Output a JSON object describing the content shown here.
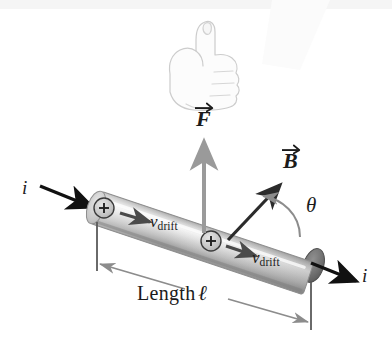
{
  "figure": {
    "background_color": "#ffffff"
  },
  "labels": {
    "force_vector": "F",
    "field_vector": "B",
    "angle": "θ",
    "current_left": "i",
    "current_right": "i",
    "drift_velocity_letter": "v",
    "drift_velocity_subscript": "drift",
    "length_text": "Length",
    "length_symbol": "ℓ",
    "charge_carrier": "+"
  },
  "colors": {
    "ink": "#1b1b1b",
    "current_arrow": "#111111",
    "field_arrow": "#2b2b2b",
    "force_arrow": "#9a9a9a",
    "dimension_line": "#8c8c8c",
    "arc": "#8c8c8c",
    "wire_light": "#f0f0f0",
    "wire_mid": "#b9b9b9",
    "wire_dark": "#8a8a8a",
    "wire_cap": "#6e6e6e",
    "hand_outline": "#cfcfcf",
    "top_band": "#f4f4f4"
  },
  "elements": {
    "wire": "grey cylindrical conductor tilted down to the right",
    "charge_carriers": 2,
    "drift_arrows": 2,
    "hand": "right hand thumbs-up indicating right-hand rule",
    "dimension_line": "double arrow spanning the wire length"
  }
}
